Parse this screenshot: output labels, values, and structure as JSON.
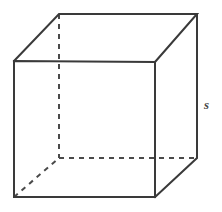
{
  "figure": {
    "name": "cube-diagram",
    "type": "geometric-solid",
    "shape": "cube",
    "background_color": "#ffffff",
    "stroke_color": "#3a3a3a",
    "hidden_stroke_color": "#4a4a4a",
    "labels": {
      "side_length": "s"
    },
    "label_positions": {
      "side_length_x": 204,
      "side_length_y": 98
    },
    "vertices": {
      "front_top_left": [
        14,
        61
      ],
      "front_top_right": [
        155,
        62
      ],
      "front_bottom_right": [
        155,
        197
      ],
      "front_bottom_left": [
        14,
        197
      ],
      "back_top_left": [
        59,
        14
      ],
      "back_top_right": [
        197,
        14
      ],
      "back_bottom_right": [
        197,
        158
      ],
      "back_bottom_left": [
        59,
        158
      ]
    },
    "edges_visible": [
      "front-top",
      "front-right",
      "front-bottom",
      "front-left",
      "top-back",
      "top-left-diagonal",
      "top-right-diagonal",
      "back-right-vertical",
      "bottom-right-diagonal"
    ],
    "edges_hidden": [
      "back-left-vertical",
      "back-bottom-horizontal",
      "bottom-left-diagonal"
    ]
  }
}
